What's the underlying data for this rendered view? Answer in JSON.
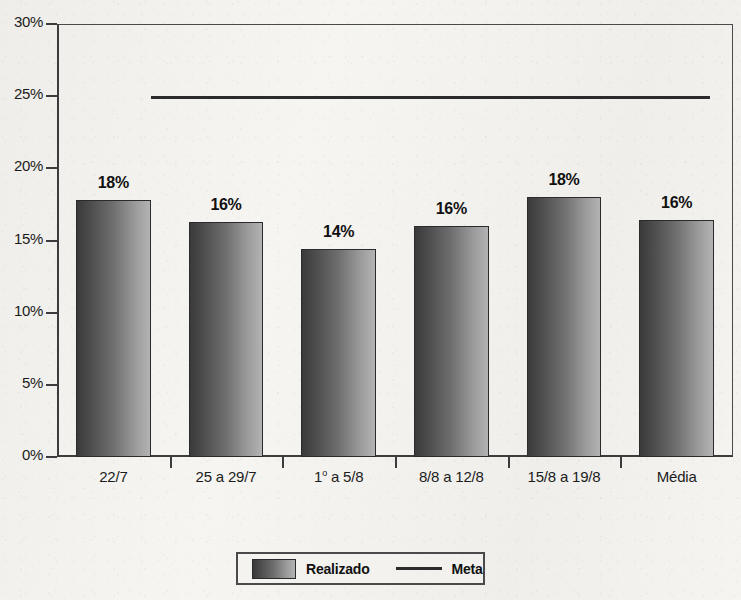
{
  "chart_data": {
    "type": "bar",
    "title": "",
    "subtitle": "",
    "xlabel": "",
    "ylabel": "",
    "categories": [
      "22/7",
      "25 a 29/7",
      "1º a 5/8",
      "8/8 a 12/8",
      "15/8 a 19/8",
      "Média"
    ],
    "category_label_html": [
      "22/7",
      "25 a 29/7",
      "1<sup>o</sup> a 5/8",
      "8/8 a 12/8",
      "15/8 a 19/8",
      "Média"
    ],
    "series": [
      {
        "name": "Realizado",
        "type": "bar",
        "values": [
          17.8,
          16.3,
          14.4,
          16.0,
          18.0,
          16.4
        ],
        "data_labels": [
          "18%",
          "16%",
          "14%",
          "16%",
          "18%",
          "16%"
        ]
      },
      {
        "name": "Meta",
        "type": "line",
        "value": 25,
        "label": "25%",
        "spans_categories": [
          "22/7",
          "25 a 29/7",
          "1º a 5/8",
          "8/8 a 12/8",
          "15/8 a 19/8"
        ]
      }
    ],
    "ylim": [
      0,
      30
    ],
    "ytick_values": [
      0,
      5,
      10,
      15,
      20,
      25,
      30
    ],
    "ytick_labels": [
      "0%",
      "5%",
      "10%",
      "15%",
      "20%",
      "25%",
      "30%"
    ],
    "grid": false,
    "legend_position": "bottom-center",
    "legend_entries": [
      {
        "label": "Realizado",
        "marker": "gradient-bar-swatch"
      },
      {
        "label": "Meta",
        "marker": "line"
      }
    ],
    "colors": {
      "bar_gradient_dark": "#3a3a3a",
      "bar_gradient_light": "#b3b3b3",
      "bar_outline": "#2b2b2b",
      "meta_line": "#2b2b2b",
      "axis": "#3c3c3c",
      "text": "#1c1c1c",
      "background": "#f3f2ee"
    }
  }
}
